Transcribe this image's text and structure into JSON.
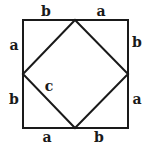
{
  "diagram": {
    "outer_square": {
      "x1": 23,
      "y1": 20,
      "x2": 128,
      "y2": 128
    },
    "inner_square_vertices": [
      [
        75,
        20
      ],
      [
        128,
        74
      ],
      [
        75,
        128
      ],
      [
        23,
        74
      ]
    ],
    "colors": {
      "stroke": "#1a1a1a",
      "background": "#ffffff"
    },
    "labels": {
      "top_left": "b",
      "top_right": "a",
      "left_top": "a",
      "left_bottom": "b",
      "right_top": "b",
      "right_bottom": "a",
      "bottom_left": "a",
      "bottom_right": "b",
      "hypotenuse": "c"
    }
  }
}
